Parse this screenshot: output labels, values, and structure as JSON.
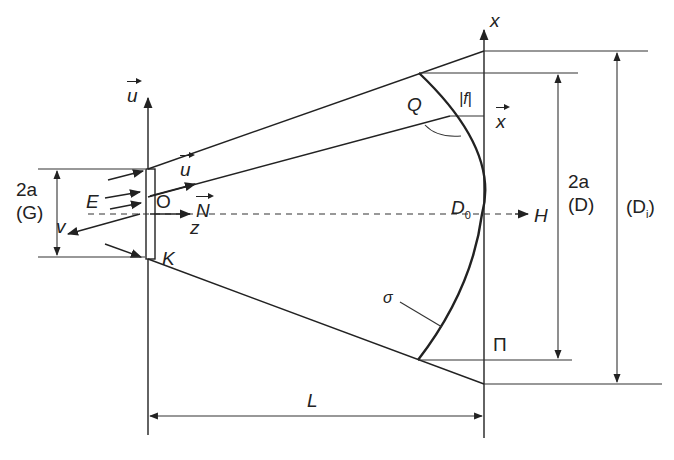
{
  "diagram": {
    "labels": {
      "u_vec_axis": "u",
      "u_vec_ray": "u",
      "N_vec": "N",
      "x_axis": "x",
      "x_vec": "x",
      "aperture_G_top": "2a",
      "aperture_G_bottom": "(G)",
      "aperture_D_top": "2a",
      "aperture_D_bottom": "(D)",
      "aperture_Di": "(D",
      "aperture_Di_sub": "i",
      "aperture_Di_close": ")",
      "E": "E",
      "O": "O",
      "z": "z",
      "v": "v",
      "K": "K",
      "Q": "Q",
      "f_abs": "|f|",
      "D0": "D",
      "D0_sub": "0",
      "H": "H",
      "sigma": "σ",
      "Pi": "Π",
      "L": "L"
    }
  }
}
